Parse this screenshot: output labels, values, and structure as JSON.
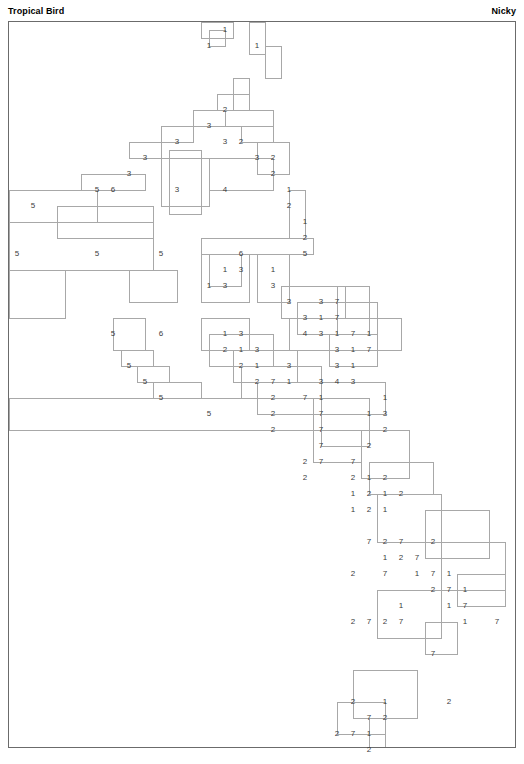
{
  "header": {
    "title": "Tropical Bird",
    "author": "Nicky"
  },
  "grid": {
    "origin_x": 8,
    "origin_y": 21,
    "cell": 16,
    "cols": 31,
    "rows": 45,
    "border_color": "#6b6b6b",
    "line_color": "#a8a8a8",
    "number_color": "#3c3c3c",
    "background": "#ffffff"
  },
  "chart_data": {
    "type": "table",
    "title": "Tropical Bird",
    "subtitle": "Nicky",
    "xlabel": "",
    "ylabel": "",
    "grid": true,
    "legend": "none",
    "clues": [
      {
        "c": 13,
        "r": 0,
        "v": "1"
      },
      {
        "c": 12,
        "r": 1,
        "v": "1"
      },
      {
        "c": 15,
        "r": 1,
        "v": "1"
      },
      {
        "c": 13,
        "r": 5,
        "v": "2"
      },
      {
        "c": 12,
        "r": 6,
        "v": "3"
      },
      {
        "c": 10,
        "r": 7,
        "v": "3"
      },
      {
        "c": 13,
        "r": 7,
        "v": "3"
      },
      {
        "c": 14,
        "r": 7,
        "v": "2"
      },
      {
        "c": 8,
        "r": 8,
        "v": "3"
      },
      {
        "c": 15,
        "r": 8,
        "v": "3"
      },
      {
        "c": 16,
        "r": 8,
        "v": "2"
      },
      {
        "c": 7,
        "r": 9,
        "v": "3"
      },
      {
        "c": 16,
        "r": 9,
        "v": "2"
      },
      {
        "c": 5,
        "r": 10,
        "v": "5"
      },
      {
        "c": 6,
        "r": 10,
        "v": "6"
      },
      {
        "c": 10,
        "r": 10,
        "v": "3"
      },
      {
        "c": 13,
        "r": 10,
        "v": "4"
      },
      {
        "c": 17,
        "r": 10,
        "v": "1"
      },
      {
        "c": 17,
        "r": 11,
        "v": "2"
      },
      {
        "c": 1,
        "r": 11,
        "v": "5"
      },
      {
        "c": 18,
        "r": 12,
        "v": "1"
      },
      {
        "c": 18,
        "r": 13,
        "v": "2"
      },
      {
        "c": 0,
        "r": 14,
        "v": "5"
      },
      {
        "c": 5,
        "r": 14,
        "v": "5"
      },
      {
        "c": 9,
        "r": 14,
        "v": "5"
      },
      {
        "c": 14,
        "r": 14,
        "v": "6"
      },
      {
        "c": 18,
        "r": 14,
        "v": "5"
      },
      {
        "c": 13,
        "r": 15,
        "v": "1"
      },
      {
        "c": 14,
        "r": 15,
        "v": "3"
      },
      {
        "c": 16,
        "r": 15,
        "v": "1"
      },
      {
        "c": 12,
        "r": 16,
        "v": "1"
      },
      {
        "c": 13,
        "r": 16,
        "v": "3"
      },
      {
        "c": 16,
        "r": 16,
        "v": "3"
      },
      {
        "c": 17,
        "r": 17,
        "v": "3"
      },
      {
        "c": 19,
        "r": 17,
        "v": "3"
      },
      {
        "c": 20,
        "r": 17,
        "v": "7"
      },
      {
        "c": 18,
        "r": 18,
        "v": "3"
      },
      {
        "c": 19,
        "r": 18,
        "v": "1"
      },
      {
        "c": 20,
        "r": 18,
        "v": "7"
      },
      {
        "c": 6,
        "r": 19,
        "v": "5"
      },
      {
        "c": 9,
        "r": 19,
        "v": "6"
      },
      {
        "c": 13,
        "r": 19,
        "v": "1"
      },
      {
        "c": 14,
        "r": 19,
        "v": "3"
      },
      {
        "c": 18,
        "r": 19,
        "v": "4"
      },
      {
        "c": 19,
        "r": 19,
        "v": "3"
      },
      {
        "c": 20,
        "r": 19,
        "v": "1"
      },
      {
        "c": 21,
        "r": 19,
        "v": "7"
      },
      {
        "c": 22,
        "r": 19,
        "v": "1"
      },
      {
        "c": 13,
        "r": 20,
        "v": "2"
      },
      {
        "c": 14,
        "r": 20,
        "v": "1"
      },
      {
        "c": 15,
        "r": 20,
        "v": "3"
      },
      {
        "c": 20,
        "r": 20,
        "v": "3"
      },
      {
        "c": 21,
        "r": 20,
        "v": "1"
      },
      {
        "c": 22,
        "r": 20,
        "v": "7"
      },
      {
        "c": 7,
        "r": 21,
        "v": "5"
      },
      {
        "c": 14,
        "r": 21,
        "v": "2"
      },
      {
        "c": 15,
        "r": 21,
        "v": "1"
      },
      {
        "c": 17,
        "r": 21,
        "v": "3"
      },
      {
        "c": 20,
        "r": 21,
        "v": "3"
      },
      {
        "c": 21,
        "r": 21,
        "v": "1"
      },
      {
        "c": 8,
        "r": 22,
        "v": "5"
      },
      {
        "c": 15,
        "r": 22,
        "v": "2"
      },
      {
        "c": 16,
        "r": 22,
        "v": "7"
      },
      {
        "c": 17,
        "r": 22,
        "v": "1"
      },
      {
        "c": 19,
        "r": 22,
        "v": "3"
      },
      {
        "c": 20,
        "r": 22,
        "v": "4"
      },
      {
        "c": 21,
        "r": 22,
        "v": "3"
      },
      {
        "c": 9,
        "r": 23,
        "v": "5"
      },
      {
        "c": 16,
        "r": 23,
        "v": "2"
      },
      {
        "c": 18,
        "r": 23,
        "v": "7"
      },
      {
        "c": 19,
        "r": 23,
        "v": "1"
      },
      {
        "c": 23,
        "r": 23,
        "v": "1"
      },
      {
        "c": 12,
        "r": 24,
        "v": "5"
      },
      {
        "c": 16,
        "r": 24,
        "v": "2"
      },
      {
        "c": 19,
        "r": 24,
        "v": "7"
      },
      {
        "c": 22,
        "r": 24,
        "v": "1"
      },
      {
        "c": 23,
        "r": 24,
        "v": "3"
      },
      {
        "c": 16,
        "r": 25,
        "v": "2"
      },
      {
        "c": 19,
        "r": 25,
        "v": "7"
      },
      {
        "c": 23,
        "r": 25,
        "v": "2"
      },
      {
        "c": 19,
        "r": 26,
        "v": "7"
      },
      {
        "c": 22,
        "r": 26,
        "v": "2"
      },
      {
        "c": 18,
        "r": 27,
        "v": "2"
      },
      {
        "c": 19,
        "r": 27,
        "v": "7"
      },
      {
        "c": 21,
        "r": 27,
        "v": "7"
      },
      {
        "c": 18,
        "r": 28,
        "v": "2"
      },
      {
        "c": 21,
        "r": 28,
        "v": "2"
      },
      {
        "c": 22,
        "r": 28,
        "v": "1"
      },
      {
        "c": 23,
        "r": 28,
        "v": "2"
      },
      {
        "c": 21,
        "r": 29,
        "v": "1"
      },
      {
        "c": 22,
        "r": 29,
        "v": "2"
      },
      {
        "c": 23,
        "r": 29,
        "v": "1"
      },
      {
        "c": 24,
        "r": 29,
        "v": "2"
      },
      {
        "c": 21,
        "r": 30,
        "v": "1"
      },
      {
        "c": 22,
        "r": 30,
        "v": "2"
      },
      {
        "c": 23,
        "r": 30,
        "v": "1"
      },
      {
        "c": 22,
        "r": 32,
        "v": "7"
      },
      {
        "c": 23,
        "r": 32,
        "v": "2"
      },
      {
        "c": 24,
        "r": 32,
        "v": "7"
      },
      {
        "c": 26,
        "r": 32,
        "v": "2"
      },
      {
        "c": 23,
        "r": 33,
        "v": "1"
      },
      {
        "c": 24,
        "r": 33,
        "v": "2"
      },
      {
        "c": 25,
        "r": 33,
        "v": "7"
      },
      {
        "c": 21,
        "r": 34,
        "v": "2"
      },
      {
        "c": 23,
        "r": 34,
        "v": "7"
      },
      {
        "c": 25,
        "r": 34,
        "v": "1"
      },
      {
        "c": 26,
        "r": 34,
        "v": "7"
      },
      {
        "c": 27,
        "r": 34,
        "v": "1"
      },
      {
        "c": 26,
        "r": 35,
        "v": "2"
      },
      {
        "c": 27,
        "r": 35,
        "v": "7"
      },
      {
        "c": 28,
        "r": 35,
        "v": "1"
      },
      {
        "c": 24,
        "r": 36,
        "v": "1"
      },
      {
        "c": 27,
        "r": 36,
        "v": "1"
      },
      {
        "c": 28,
        "r": 36,
        "v": "7"
      },
      {
        "c": 22,
        "r": 37,
        "v": "7"
      },
      {
        "c": 23,
        "r": 37,
        "v": "2"
      },
      {
        "c": 24,
        "r": 37,
        "v": "7"
      },
      {
        "c": 28,
        "r": 37,
        "v": "1"
      },
      {
        "c": 21,
        "r": 37,
        "v": "2"
      },
      {
        "c": 30,
        "r": 37,
        "v": "7"
      },
      {
        "c": 26,
        "r": 39,
        "v": "7"
      },
      {
        "c": 21,
        "r": 42,
        "v": "2"
      },
      {
        "c": 23,
        "r": 42,
        "v": "1"
      },
      {
        "c": 27,
        "r": 42,
        "v": "2"
      },
      {
        "c": 22,
        "r": 43,
        "v": "7"
      },
      {
        "c": 23,
        "r": 43,
        "v": "2"
      },
      {
        "c": 20,
        "r": 44,
        "v": "2"
      },
      {
        "c": 21,
        "r": 44,
        "v": "7"
      },
      {
        "c": 22,
        "r": 44,
        "v": "1"
      },
      {
        "c": 22,
        "r": 45,
        "v": "2"
      }
    ],
    "region_outlines": [
      {
        "x": 200,
        "y": 21,
        "w": 32,
        "h": 16
      },
      {
        "x": 208,
        "y": 29,
        "w": 16,
        "h": 16
      },
      {
        "x": 248,
        "y": 21,
        "w": 16,
        "h": 32
      },
      {
        "x": 264,
        "y": 45,
        "w": 16,
        "h": 32
      },
      {
        "x": 232,
        "y": 77,
        "w": 16,
        "h": 32
      },
      {
        "x": 216,
        "y": 93,
        "w": 32,
        "h": 16
      },
      {
        "x": 192,
        "y": 109,
        "w": 32,
        "h": 16
      },
      {
        "x": 224,
        "y": 109,
        "w": 48,
        "h": 16
      },
      {
        "x": 160,
        "y": 125,
        "w": 32,
        "h": 16
      },
      {
        "x": 240,
        "y": 125,
        "w": 32,
        "h": 16
      },
      {
        "x": 128,
        "y": 141,
        "w": 32,
        "h": 16
      },
      {
        "x": 256,
        "y": 141,
        "w": 32,
        "h": 32
      },
      {
        "x": 160,
        "y": 157,
        "w": 48,
        "h": 48
      },
      {
        "x": 168,
        "y": 149,
        "w": 32,
        "h": 64
      },
      {
        "x": 208,
        "y": 157,
        "w": 64,
        "h": 32
      },
      {
        "x": 80,
        "y": 173,
        "w": 64,
        "h": 16
      },
      {
        "x": 288,
        "y": 189,
        "w": 16,
        "h": 48
      },
      {
        "x": 8,
        "y": 189,
        "w": 88,
        "h": 32
      },
      {
        "x": 56,
        "y": 205,
        "w": 96,
        "h": 32
      },
      {
        "x": 8,
        "y": 221,
        "w": 144,
        "h": 48
      },
      {
        "x": 200,
        "y": 237,
        "w": 112,
        "h": 16
      },
      {
        "x": 8,
        "y": 269,
        "w": 56,
        "h": 48
      },
      {
        "x": 128,
        "y": 269,
        "w": 48,
        "h": 32
      },
      {
        "x": 200,
        "y": 253,
        "w": 48,
        "h": 48
      },
      {
        "x": 208,
        "y": 253,
        "w": 32,
        "h": 32
      },
      {
        "x": 256,
        "y": 253,
        "w": 32,
        "h": 48
      },
      {
        "x": 280,
        "y": 285,
        "w": 64,
        "h": 32
      },
      {
        "x": 336,
        "y": 285,
        "w": 32,
        "h": 48
      },
      {
        "x": 296,
        "y": 301,
        "w": 80,
        "h": 32
      },
      {
        "x": 288,
        "y": 317,
        "w": 112,
        "h": 32
      },
      {
        "x": 112,
        "y": 317,
        "w": 32,
        "h": 32
      },
      {
        "x": 200,
        "y": 317,
        "w": 48,
        "h": 32
      },
      {
        "x": 208,
        "y": 333,
        "w": 64,
        "h": 32
      },
      {
        "x": 328,
        "y": 333,
        "w": 48,
        "h": 32
      },
      {
        "x": 120,
        "y": 349,
        "w": 32,
        "h": 16
      },
      {
        "x": 232,
        "y": 349,
        "w": 64,
        "h": 32
      },
      {
        "x": 136,
        "y": 365,
        "w": 32,
        "h": 16
      },
      {
        "x": 240,
        "y": 365,
        "w": 80,
        "h": 32
      },
      {
        "x": 152,
        "y": 381,
        "w": 48,
        "h": 16
      },
      {
        "x": 256,
        "y": 381,
        "w": 128,
        "h": 32
      },
      {
        "x": 8,
        "y": 397,
        "w": 304,
        "h": 32
      },
      {
        "x": 320,
        "y": 397,
        "w": 48,
        "h": 48
      },
      {
        "x": 312,
        "y": 429,
        "w": 48,
        "h": 32
      },
      {
        "x": 360,
        "y": 429,
        "w": 48,
        "h": 48
      },
      {
        "x": 368,
        "y": 461,
        "w": 64,
        "h": 32
      },
      {
        "x": 376,
        "y": 493,
        "w": 64,
        "h": 48
      },
      {
        "x": 424,
        "y": 509,
        "w": 64,
        "h": 48
      },
      {
        "x": 440,
        "y": 541,
        "w": 64,
        "h": 48
      },
      {
        "x": 456,
        "y": 573,
        "w": 48,
        "h": 32
      },
      {
        "x": 376,
        "y": 589,
        "w": 64,
        "h": 48
      },
      {
        "x": 424,
        "y": 621,
        "w": 32,
        "h": 32
      },
      {
        "x": 352,
        "y": 669,
        "w": 64,
        "h": 48
      },
      {
        "x": 336,
        "y": 701,
        "w": 48,
        "h": 32
      },
      {
        "x": 368,
        "y": 717,
        "w": 16,
        "h": 32
      }
    ]
  }
}
